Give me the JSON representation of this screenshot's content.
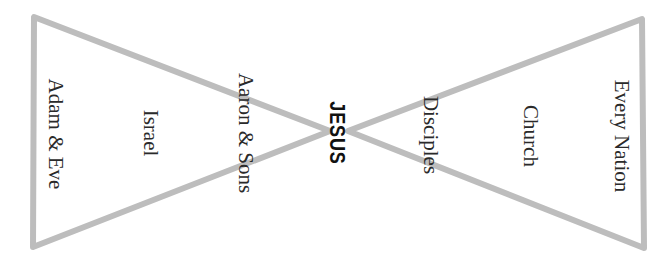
{
  "diagram": {
    "type": "hourglass",
    "stroke_color": "#bdbdbd",
    "stroke_width": 6,
    "left_triangle": {
      "points": [
        [
          34,
          17
        ],
        [
          33,
          247
        ],
        [
          330,
          131
        ]
      ]
    },
    "right_triangle": {
      "points": [
        [
          642,
          19
        ],
        [
          644,
          248
        ],
        [
          348,
          131
        ]
      ]
    },
    "center_label": "JESUS",
    "left_labels": [
      "Adam  &  Eve",
      "Israel",
      "Aaron & Sons"
    ],
    "right_labels": [
      "Disciples",
      "Church",
      "Every Nation"
    ]
  }
}
